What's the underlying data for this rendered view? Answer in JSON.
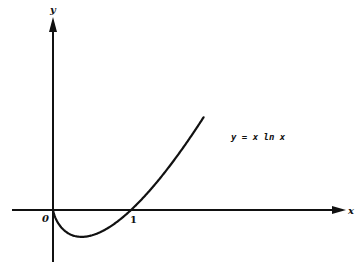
{
  "chart_data": {
    "type": "line",
    "title": "",
    "xlabel": "x",
    "ylabel": "y",
    "annotations": [
      {
        "text": "y = x ln x",
        "position": "right of curve"
      }
    ],
    "x_ticks": [
      {
        "value": 0,
        "label": "0"
      },
      {
        "value": 1,
        "label": "1"
      }
    ],
    "function": "y = x ln x",
    "series": [
      {
        "name": "y = x ln x",
        "x": [
          0.0,
          0.1,
          0.2,
          0.368,
          0.5,
          0.75,
          1.0,
          1.25,
          1.5,
          1.75,
          2.0
        ],
        "y": [
          0.0,
          -0.23,
          -0.322,
          -0.368,
          -0.347,
          -0.216,
          0.0,
          0.279,
          0.608,
          0.979,
          1.386
        ]
      }
    ],
    "xlim": [
      -0.5,
      3.7
    ],
    "ylim": [
      -0.65,
      2.5
    ],
    "grid": false,
    "legend": "none"
  },
  "labels": {
    "x_axis": "x",
    "y_axis": "y",
    "origin": "0",
    "one": "1",
    "curve": "y = x ln x"
  },
  "colors": {
    "ink": "#111111",
    "background": "#ffffff"
  }
}
